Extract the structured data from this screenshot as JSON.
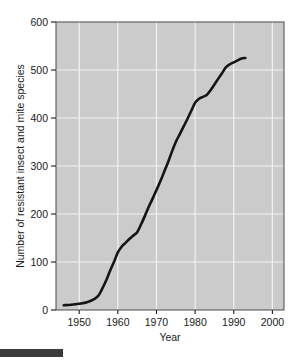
{
  "chart_data": {
    "type": "line",
    "title": "",
    "xlabel": "Year",
    "ylabel": "Number of resistant insect and mite species",
    "xlim": [
      1944,
      2003
    ],
    "ylim": [
      0,
      600
    ],
    "xticks": [
      1950,
      1960,
      1970,
      1980,
      1990,
      2000
    ],
    "xtick_labels": [
      "1950",
      "1960",
      "1970",
      "1980",
      "1990",
      "2000"
    ],
    "yticks": [
      0,
      100,
      200,
      300,
      400,
      500,
      600
    ],
    "ytick_labels": [
      "0",
      "100",
      "200",
      "300",
      "400",
      "500",
      "600"
    ],
    "grid": true,
    "legend": "none",
    "series": [
      {
        "name": "Resistant insect and mite species",
        "color": "#141414",
        "x": [
          1946,
          1948,
          1950,
          1952,
          1954,
          1955,
          1956,
          1957,
          1958,
          1959,
          1960,
          1961,
          1962,
          1963,
          1964,
          1965,
          1966,
          1967,
          1968,
          1969,
          1970,
          1971,
          1972,
          1973,
          1974,
          1975,
          1976,
          1977,
          1978,
          1979,
          1980,
          1981,
          1982,
          1983,
          1984,
          1985,
          1986,
          1987,
          1988,
          1989,
          1990,
          1991,
          1992,
          1993
        ],
        "y": [
          10,
          11,
          13,
          16,
          23,
          30,
          45,
          62,
          82,
          100,
          120,
          132,
          140,
          148,
          155,
          162,
          178,
          196,
          215,
          232,
          250,
          268,
          288,
          308,
          330,
          350,
          366,
          382,
          398,
          415,
          432,
          440,
          444,
          448,
          458,
          470,
          482,
          494,
          506,
          512,
          516,
          520,
          524,
          525
        ]
      }
    ]
  },
  "figure": {
    "footer_bar_name": "page-footer-bar"
  }
}
